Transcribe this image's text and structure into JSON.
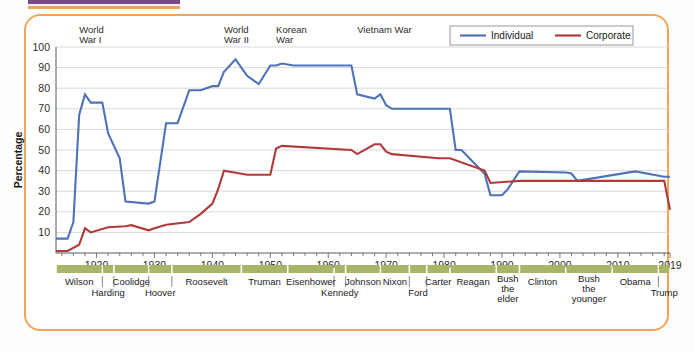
{
  "card": {
    "border_color": "#f0a659",
    "background": "#ffffff"
  },
  "page_artifacts": {
    "top_bar_color": "#7a4a86",
    "top_bar_accent": "#e8a95c"
  },
  "legend": {
    "position": "top-right",
    "items": [
      {
        "label": "Individual",
        "color": "#4f72b8"
      },
      {
        "label": "Corporate",
        "color": "#b03a3a"
      }
    ]
  },
  "annotations": [
    {
      "text_line1": "World",
      "text_line2": "War I",
      "year": 1917
    },
    {
      "text_line1": "World",
      "text_line2": "War II",
      "year": 1942
    },
    {
      "text_line1": "Korean",
      "text_line2": "War",
      "year": 1951
    },
    {
      "text_line1": "Vietnam War",
      "text_line2": "",
      "year": 1965
    }
  ],
  "presidents": [
    {
      "name": "Wilson",
      "start": 1913,
      "end": 1921,
      "row": 0
    },
    {
      "name": "Harding",
      "start": 1921,
      "end": 1923,
      "row": 1
    },
    {
      "name": "Coolidge",
      "start": 1923,
      "end": 1929,
      "row": 0
    },
    {
      "name": "Hoover",
      "start": 1929,
      "end": 1933,
      "row": 1
    },
    {
      "name": "Roosevelt",
      "start": 1933,
      "end": 1945,
      "row": 0
    },
    {
      "name": "Truman",
      "start": 1945,
      "end": 1953,
      "row": 0
    },
    {
      "name": "Eisenhower",
      "start": 1953,
      "end": 1961,
      "row": 0
    },
    {
      "name": "Kennedy",
      "start": 1961,
      "end": 1963,
      "row": 1
    },
    {
      "name": "Johnson",
      "start": 1963,
      "end": 1969,
      "row": 0
    },
    {
      "name": "Nixon",
      "start": 1969,
      "end": 1974,
      "row": 0
    },
    {
      "name": "Ford",
      "start": 1974,
      "end": 1977,
      "row": 1
    },
    {
      "name": "Carter",
      "start": 1977,
      "end": 1981,
      "row": 0
    },
    {
      "name": "Reagan",
      "start": 1981,
      "end": 1989,
      "row": 0
    },
    {
      "name": "Bush the elder",
      "start": 1989,
      "end": 1993,
      "row": 0
    },
    {
      "name": "Clinton",
      "start": 1993,
      "end": 2001,
      "row": 0
    },
    {
      "name": "Bush the younger",
      "start": 2001,
      "end": 2009,
      "row": 0
    },
    {
      "name": "Obama",
      "start": 2009,
      "end": 2017,
      "row": 0
    },
    {
      "name": "Trump",
      "start": 2017,
      "end": 2019,
      "row": 1
    }
  ],
  "chart_data": {
    "type": "line",
    "title": "",
    "xlabel": "",
    "ylabel": "Percentage",
    "xlim": [
      1913,
      2019
    ],
    "ylim": [
      0,
      100
    ],
    "grid": true,
    "legend_position": "top-right",
    "xticks": [
      1920,
      1930,
      1940,
      1950,
      1960,
      1970,
      1980,
      1990,
      2000,
      2010,
      2019
    ],
    "xtick_labels": [
      "1920",
      "1930",
      "1940",
      "1950",
      "1960",
      "1970",
      "1980",
      "1990",
      "2000",
      "2010",
      "2019"
    ],
    "yticks": [
      10,
      20,
      30,
      40,
      50,
      60,
      70,
      80,
      90,
      100
    ],
    "ytick_labels": [
      "10",
      "20",
      "30",
      "40",
      "50",
      "60",
      "70",
      "80",
      "90",
      "100"
    ],
    "minor_xtick_interval": 2,
    "series": [
      {
        "name": "Individual",
        "color": "#4f72b8",
        "x": [
          1913,
          1915,
          1916,
          1917,
          1918,
          1919,
          1921,
          1922,
          1924,
          1925,
          1929,
          1930,
          1932,
          1934,
          1936,
          1938,
          1940,
          1941,
          1942,
          1944,
          1946,
          1948,
          1950,
          1951,
          1952,
          1954,
          1964,
          1965,
          1968,
          1969,
          1970,
          1971,
          1976,
          1977,
          1979,
          1981,
          1982,
          1983,
          1987,
          1988,
          1990,
          1991,
          1993,
          2001,
          2002,
          2003,
          2013,
          2018,
          2019
        ],
        "values": [
          7,
          7,
          15,
          67,
          77,
          73,
          73,
          58,
          46,
          25,
          24,
          25,
          63,
          63,
          79,
          79,
          81,
          81,
          88,
          94,
          86,
          82,
          91,
          91,
          92,
          91,
          91,
          77,
          75,
          77,
          71.75,
          70,
          70,
          70,
          70,
          70,
          50,
          50,
          38.5,
          28,
          28,
          31,
          39.6,
          39.1,
          38.6,
          35,
          39.6,
          37,
          37
        ]
      },
      {
        "name": "Corporate",
        "color": "#b03a3a",
        "x": [
          1913,
          1915,
          1917,
          1918,
          1919,
          1922,
          1925,
          1926,
          1929,
          1930,
          1932,
          1936,
          1938,
          1940,
          1941,
          1942,
          1946,
          1950,
          1951,
          1952,
          1964,
          1965,
          1968,
          1969,
          1970,
          1971,
          1979,
          1981,
          1987,
          1988,
          1993,
          2018,
          2019
        ],
        "values": [
          1,
          1,
          4,
          12,
          10,
          12.5,
          13,
          13.5,
          11,
          12,
          13.75,
          15,
          19,
          24,
          31,
          40,
          38,
          38,
          50.75,
          52,
          50,
          48,
          52.8,
          52.8,
          49.2,
          48,
          46,
          46,
          40,
          34,
          35,
          35,
          21
        ]
      }
    ]
  }
}
